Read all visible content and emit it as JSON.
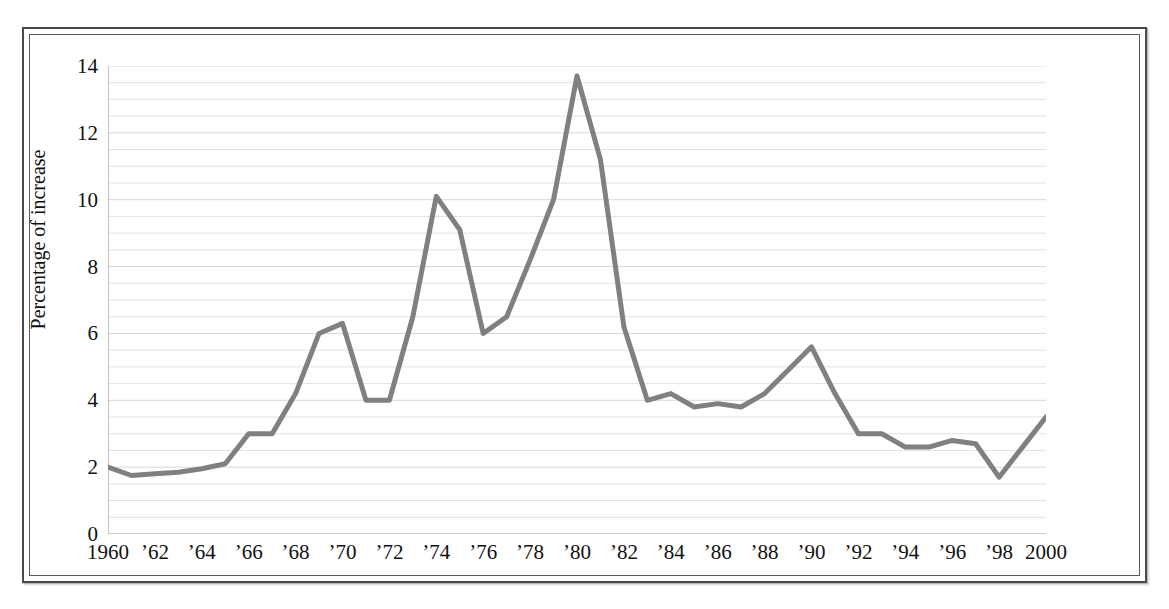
{
  "chart_data": {
    "type": "line",
    "title": "",
    "xlabel": "",
    "ylabel": "Percentage of increase",
    "xlim": [
      1960,
      2000
    ],
    "ylim": [
      0,
      14
    ],
    "grid": true,
    "legend": "none",
    "line_color": "#808080",
    "gridline_color": "#e2e2e2",
    "axis_color": "#9a9a9a",
    "y_ticks": [
      0,
      2,
      4,
      6,
      8,
      10,
      12,
      14
    ],
    "y_tick_labels": [
      "0",
      "2",
      "4",
      "6",
      "8",
      "10",
      "12",
      "14"
    ],
    "y_minor_step": 0.5,
    "x_tick_step": 1,
    "x_tick_labels": [
      {
        "year": 1960,
        "label": "1960"
      },
      {
        "year": 1962,
        "label": "’62"
      },
      {
        "year": 1964,
        "label": "’64"
      },
      {
        "year": 1966,
        "label": "’66"
      },
      {
        "year": 1968,
        "label": "’68"
      },
      {
        "year": 1970,
        "label": "’70"
      },
      {
        "year": 1972,
        "label": "’72"
      },
      {
        "year": 1974,
        "label": "’74"
      },
      {
        "year": 1976,
        "label": "’76"
      },
      {
        "year": 1978,
        "label": "’78"
      },
      {
        "year": 1980,
        "label": "’80"
      },
      {
        "year": 1982,
        "label": "’82"
      },
      {
        "year": 1984,
        "label": "’84"
      },
      {
        "year": 1986,
        "label": "’86"
      },
      {
        "year": 1988,
        "label": "’88"
      },
      {
        "year": 1990,
        "label": "’90"
      },
      {
        "year": 1992,
        "label": "’92"
      },
      {
        "year": 1994,
        "label": "’94"
      },
      {
        "year": 1996,
        "label": "’96"
      },
      {
        "year": 1998,
        "label": "’98"
      },
      {
        "year": 2000,
        "label": "2000"
      }
    ],
    "x": [
      1960,
      1961,
      1962,
      1963,
      1964,
      1965,
      1966,
      1967,
      1968,
      1969,
      1970,
      1971,
      1972,
      1973,
      1974,
      1975,
      1976,
      1977,
      1978,
      1979,
      1980,
      1981,
      1982,
      1983,
      1984,
      1985,
      1986,
      1987,
      1988,
      1989,
      1990,
      1991,
      1992,
      1993,
      1994,
      1995,
      1996,
      1997,
      1998,
      1999,
      2000
    ],
    "values": [
      2.0,
      1.75,
      1.8,
      1.85,
      1.95,
      2.1,
      3.0,
      3.0,
      4.2,
      6.0,
      6.3,
      4.0,
      4.0,
      6.5,
      10.1,
      9.1,
      6.0,
      6.5,
      8.2,
      10.0,
      13.7,
      11.2,
      6.2,
      4.0,
      4.2,
      3.8,
      3.9,
      3.8,
      4.2,
      4.9,
      5.6,
      4.2,
      3.0,
      3.0,
      2.6,
      2.6,
      2.8,
      2.7,
      1.7,
      2.6,
      3.5
    ],
    "series_name": "Percentage of increase"
  }
}
